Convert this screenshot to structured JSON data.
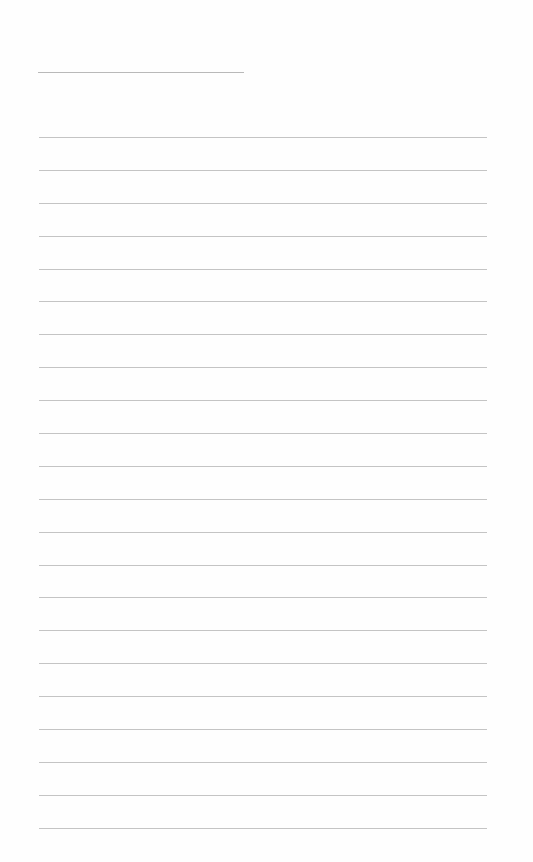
{
  "document": {
    "type": "blank lined paper",
    "header_line": {
      "text": ""
    },
    "ruled_lines": [
      {
        "text": ""
      },
      {
        "text": ""
      },
      {
        "text": ""
      },
      {
        "text": ""
      },
      {
        "text": ""
      },
      {
        "text": ""
      },
      {
        "text": ""
      },
      {
        "text": ""
      },
      {
        "text": ""
      },
      {
        "text": ""
      },
      {
        "text": ""
      },
      {
        "text": ""
      },
      {
        "text": ""
      },
      {
        "text": ""
      },
      {
        "text": ""
      },
      {
        "text": ""
      },
      {
        "text": ""
      },
      {
        "text": ""
      },
      {
        "text": ""
      },
      {
        "text": ""
      },
      {
        "text": ""
      },
      {
        "text": ""
      }
    ],
    "colors": {
      "paper": "#fefefe",
      "rule": "#c4c4c4"
    }
  }
}
